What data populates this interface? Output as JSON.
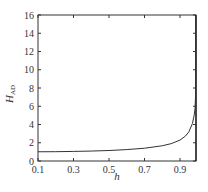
{
  "chart_data": {
    "type": "line",
    "title": "",
    "xlabel": "h",
    "ylabel": "H_AD",
    "ylabel_main": "H",
    "ylabel_sub": "AD",
    "xlim": [
      0.1,
      0.99
    ],
    "ylim": [
      0,
      16
    ],
    "grid": false,
    "legend": null,
    "x_ticks": [
      0.1,
      0.3,
      0.5,
      0.7,
      0.9
    ],
    "x_tick_labels": [
      "0.1",
      "0.3",
      "0.5",
      "0.7",
      "0.9"
    ],
    "y_ticks": [
      0,
      2,
      4,
      6,
      8,
      10,
      12,
      14,
      16
    ],
    "y_tick_labels": [
      "0",
      "2",
      "4",
      "6",
      "8",
      "10",
      "12",
      "14",
      "16"
    ],
    "series": [
      {
        "name": "H_AD(h)",
        "color": "#333333",
        "x": [
          0.1,
          0.2,
          0.3,
          0.4,
          0.5,
          0.6,
          0.7,
          0.8,
          0.85,
          0.9,
          0.93,
          0.95,
          0.97,
          0.98,
          0.985,
          0.99
        ],
        "y": [
          1.01,
          1.02,
          1.05,
          1.09,
          1.15,
          1.25,
          1.4,
          1.67,
          1.9,
          2.29,
          2.72,
          3.2,
          4.11,
          5.03,
          5.8,
          7.09
        ]
      }
    ]
  },
  "colors": {
    "axis": "#333333",
    "curve": "#333333",
    "background": "#ffffff"
  }
}
